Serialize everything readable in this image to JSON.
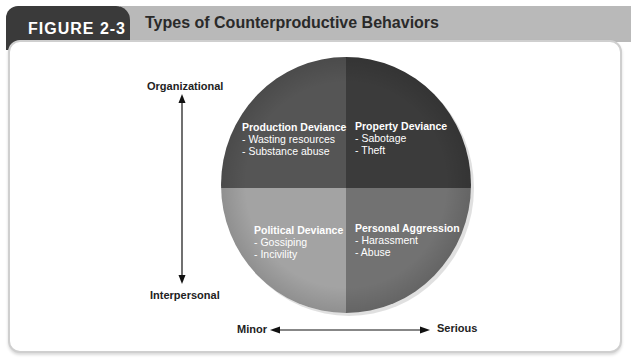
{
  "figure": {
    "number": "FIGURE 2-3",
    "title": "Types of Counterproductive Behaviors"
  },
  "axes": {
    "vertical": {
      "top": "Organizational",
      "bottom": "Interpersonal"
    },
    "horizontal": {
      "left": "Minor",
      "right": "Serious"
    }
  },
  "quadrants": [
    {
      "position": "top-left",
      "title": "Production Deviance",
      "items": [
        "- Wasting resources",
        "- Substance abuse"
      ],
      "color": "#555555"
    },
    {
      "position": "top-right",
      "title": "Property Deviance",
      "items": [
        "- Sabotage",
        "- Theft"
      ],
      "color": "#3b3b3b"
    },
    {
      "position": "bottom-left",
      "title": "Political Deviance",
      "items": [
        "- Gossiping",
        "- Incivility"
      ],
      "color": "#a3a3a3"
    },
    {
      "position": "bottom-right",
      "title": "Personal Aggression",
      "items": [
        "- Harassment",
        "- Abuse"
      ],
      "color": "#727272"
    }
  ],
  "colors": {
    "tab": "#3a3a3a",
    "title_band": "#b9b9b9"
  }
}
